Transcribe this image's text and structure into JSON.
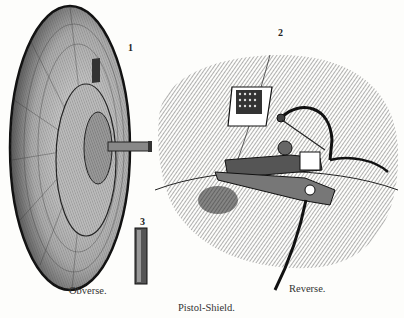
{
  "figure": {
    "title": "Pistol-Shield.",
    "captions": {
      "left": "Obverse.",
      "right": "Reverse."
    },
    "figure_numbers": [
      "1",
      "2",
      "3"
    ],
    "subjects": {
      "fig1": "shield obverse with central gun barrel",
      "fig2": "shield reverse with pistol mechanism and grated window",
      "fig3": "barrel tube"
    },
    "colors": {
      "ink": "#222222",
      "paper": "#fdfdfb",
      "shade": "#6a6a6a"
    }
  }
}
